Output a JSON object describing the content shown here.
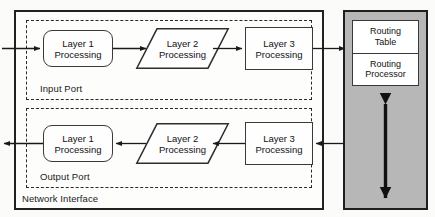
{
  "diagram": {
    "outer": {
      "label": "Network Interface"
    },
    "input_port": {
      "label": "Input Port",
      "nodes": [
        {
          "id": "in-layer1",
          "line1": "Layer 1",
          "line2": "Processing",
          "shape": "rounded-rect"
        },
        {
          "id": "in-layer2",
          "line1": "Layer 2",
          "line2": "Processing",
          "shape": "parallelogram"
        },
        {
          "id": "in-layer3",
          "line1": "Layer 3",
          "line2": "Processing",
          "shape": "rect"
        }
      ],
      "flow_direction": "left-to-right"
    },
    "output_port": {
      "label": "Output Port",
      "nodes": [
        {
          "id": "out-layer1",
          "line1": "Layer 1",
          "line2": "Processing",
          "shape": "rounded-rect"
        },
        {
          "id": "out-layer2",
          "line1": "Layer 2",
          "line2": "Processing",
          "shape": "parallelogram"
        },
        {
          "id": "out-layer3",
          "line1": "Layer 3",
          "line2": "Processing",
          "shape": "rect"
        }
      ],
      "flow_direction": "right-to-left"
    },
    "routing": {
      "table": {
        "line1": "Routing",
        "line2": "Table"
      },
      "processor": {
        "line1": "Routing",
        "line2": "Processor"
      }
    },
    "colors": {
      "panel_fill": "#b7b7b7",
      "stroke": "#1f1f1f",
      "node_stroke": "#3a3a3a",
      "page_background": "#fbfbfa"
    }
  }
}
